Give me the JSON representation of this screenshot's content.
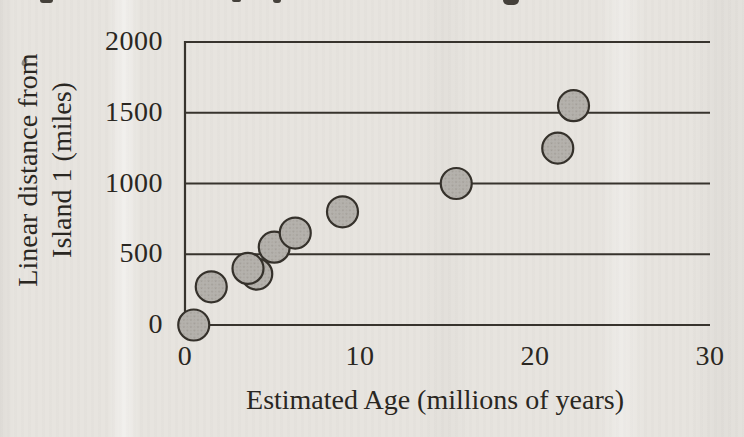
{
  "page": {
    "kind": "scanned textbook figure",
    "background_color": "#e7e4df"
  },
  "colors": {
    "paper": "#e7e4df",
    "ink": "#2a2722",
    "grid_line": "#37332d",
    "marker_fill": "#b5b2ad",
    "marker_stroke": "#35312b"
  },
  "y_axis": {
    "title_line1": "Linear distance from",
    "title_line2": "Island 1 (miles)",
    "ticks": [
      "2000",
      "1500",
      "1000",
      "500",
      "0"
    ]
  },
  "x_axis": {
    "title": "Estimated Age (millions of years)",
    "ticks": [
      "0",
      "10",
      "20",
      "30"
    ]
  },
  "chart_data": {
    "type": "scatter",
    "title": "",
    "xlabel": "Estimated Age (millions of years)",
    "ylabel": "Linear distance from Island 1 (miles)",
    "xlim": [
      0,
      30
    ],
    "ylim": [
      0,
      2000
    ],
    "x_ticks": [
      0,
      10,
      20,
      30
    ],
    "y_ticks": [
      0,
      500,
      1000,
      1500,
      2000
    ],
    "grid": "horizontal gridlines at every y tick; no right or bottom frame beyond axis lines",
    "legend": "none",
    "marker": {
      "shape": "circle",
      "radius_px": 15.5,
      "fill": "#b5b2ad",
      "stroke": "#35312b",
      "texture": "halftone-dot"
    },
    "points_note": "x = estimated age (millions of years), y = linear distance from Island 1 (miles); listed in draw order (point at x=3.6 is drawn on top of point at x=4.1)",
    "points": [
      {
        "x": 0.5,
        "y": 0
      },
      {
        "x": 1.5,
        "y": 270
      },
      {
        "x": 4.1,
        "y": 360
      },
      {
        "x": 3.6,
        "y": 400
      },
      {
        "x": 5.1,
        "y": 550
      },
      {
        "x": 6.3,
        "y": 650
      },
      {
        "x": 9.0,
        "y": 800
      },
      {
        "x": 15.5,
        "y": 1000
      },
      {
        "x": 21.3,
        "y": 1250
      },
      {
        "x": 22.2,
        "y": 1550
      }
    ]
  }
}
